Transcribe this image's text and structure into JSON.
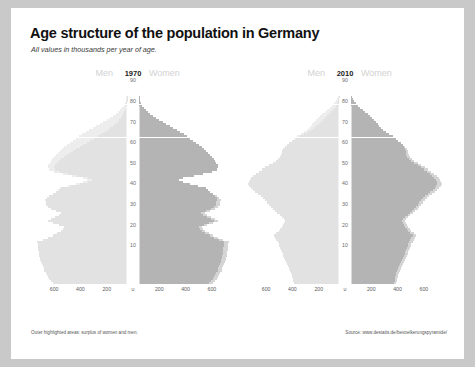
{
  "title": "Age structure of the population in Germany",
  "subtitle": "All values in thousands per year of age.",
  "footnote": "Outer highlighted areas: surplus of women and men.",
  "source": "Source: www.destatis.de/bevoelkerungspyramide/",
  "labels": {
    "men": "Men",
    "women": "Women"
  },
  "colors": {
    "men_core": "#e2e2e2",
    "men_surplus": "#ededed",
    "women_core": "#b4b4b4",
    "women_surplus": "#d5d5d5",
    "axis_text": "#6d6d6d",
    "background": "#ffffff",
    "page_margin": "#c9c9c9"
  },
  "chart_data": [
    {
      "type": "bar",
      "title": "1970",
      "subtype": "population-pyramid",
      "xlabel": "",
      "ylabel": "Age",
      "xlim": [
        -700,
        700
      ],
      "xticks": [
        600,
        400,
        200,
        0,
        200,
        400,
        600
      ],
      "xtick_labels": [
        "600",
        "400",
        "200",
        "0",
        "200",
        "400",
        "600"
      ],
      "yticks": [
        10,
        20,
        30,
        40,
        50,
        60,
        70,
        80,
        90
      ],
      "ylim": [
        0,
        95
      ],
      "grid": false,
      "legend": [
        "Men",
        "Women"
      ],
      "series": [
        {
          "name": "Men",
          "values": [
            560,
            575,
            590,
            600,
            610,
            620,
            630,
            635,
            640,
            645,
            655,
            660,
            665,
            668,
            670,
            672,
            675,
            676,
            678,
            680,
            682,
            640,
            600,
            565,
            530,
            505,
            490,
            480,
            520,
            560,
            600,
            575,
            545,
            515,
            500,
            540,
            575,
            600,
            615,
            620,
            625,
            610,
            590,
            565,
            540,
            520,
            500,
            430,
            360,
            300,
            270,
            300,
            380,
            450,
            510,
            545,
            555,
            545,
            530,
            515,
            500,
            480,
            460,
            435,
            410,
            385,
            360,
            335,
            305,
            280,
            250,
            220,
            195,
            170,
            148,
            126,
            106,
            88,
            72,
            58,
            46,
            36,
            28,
            21,
            16,
            11,
            8,
            5,
            3,
            2,
            1
          ]
        },
        {
          "name": "Women",
          "values": [
            532,
            546,
            560,
            570,
            580,
            589,
            598,
            603,
            608,
            613,
            622,
            627,
            632,
            635,
            637,
            639,
            641,
            642,
            644,
            646,
            648,
            608,
            570,
            537,
            504,
            480,
            466,
            456,
            494,
            532,
            570,
            546,
            518,
            489,
            475,
            513,
            546,
            570,
            584,
            589,
            594,
            590,
            578,
            560,
            540,
            526,
            512,
            450,
            388,
            332,
            305,
            338,
            418,
            490,
            552,
            590,
            604,
            598,
            588,
            578,
            568,
            556,
            544,
            528,
            512,
            494,
            476,
            458,
            436,
            414,
            390,
            364,
            340,
            314,
            288,
            262,
            234,
            206,
            180,
            152,
            128,
            104,
            84,
            66,
            50,
            36,
            26,
            17,
            11,
            7,
            4
          ]
        }
      ]
    },
    {
      "type": "bar",
      "title": "2010",
      "subtype": "population-pyramid",
      "xlabel": "",
      "ylabel": "Age",
      "xlim": [
        -700,
        700
      ],
      "xticks": [
        600,
        400,
        200,
        0,
        200,
        400,
        600
      ],
      "xtick_labels": [
        "600",
        "400",
        "200",
        "0",
        "200",
        "400",
        "600"
      ],
      "yticks": [
        10,
        20,
        30,
        40,
        50,
        60,
        70,
        80,
        90
      ],
      "ylim": [
        0,
        95
      ],
      "grid": false,
      "legend": [
        "Men",
        "Women"
      ],
      "series": [
        {
          "name": "Men",
          "values": [
            345,
            348,
            352,
            356,
            360,
            364,
            370,
            378,
            386,
            394,
            402,
            410,
            418,
            424,
            430,
            436,
            442,
            448,
            454,
            460,
            468,
            476,
            484,
            492,
            476,
            460,
            446,
            434,
            424,
            416,
            410,
            420,
            436,
            452,
            470,
            488,
            506,
            520,
            534,
            548,
            560,
            578,
            596,
            616,
            636,
            656,
            672,
            684,
            690,
            688,
            680,
            668,
            652,
            634,
            612,
            588,
            560,
            532,
            506,
            482,
            462,
            448,
            440,
            436,
            432,
            424,
            412,
            396,
            378,
            356,
            330,
            300,
            268,
            238,
            212,
            190,
            172,
            156,
            140,
            124,
            108,
            92,
            76,
            60,
            46,
            34,
            24,
            16,
            10,
            6,
            3
          ]
        },
        {
          "name": "Women",
          "values": [
            328,
            331,
            334,
            338,
            342,
            346,
            352,
            359,
            367,
            374,
            382,
            390,
            397,
            403,
            409,
            414,
            420,
            426,
            431,
            437,
            445,
            452,
            460,
            468,
            452,
            437,
            424,
            412,
            403,
            395,
            390,
            399,
            414,
            430,
            447,
            464,
            481,
            494,
            508,
            521,
            532,
            549,
            566,
            585,
            604,
            623,
            638,
            649,
            655,
            653,
            646,
            634,
            619,
            602,
            581,
            558,
            532,
            506,
            482,
            459,
            440,
            428,
            422,
            420,
            418,
            412,
            404,
            392,
            378,
            360,
            340,
            316,
            290,
            266,
            246,
            228,
            214,
            202,
            190,
            176,
            162,
            146,
            128,
            108,
            88,
            68,
            50,
            35,
            23,
            14,
            8
          ]
        }
      ]
    }
  ]
}
